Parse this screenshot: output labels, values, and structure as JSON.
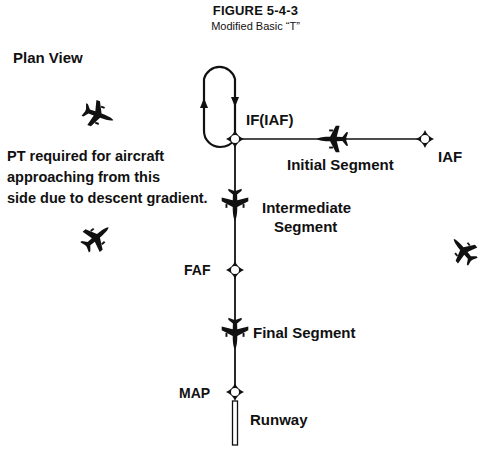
{
  "figure": {
    "title": "FIGURE 5-4-3",
    "subtitle": "Modified Basic “T”"
  },
  "view_label": "Plan View",
  "note": "PT required for aircraft\napproaching from this\nside due to descent gradient.",
  "fixes": {
    "if_iaf": {
      "label": "IF(IAF)",
      "x": 235,
      "y": 139
    },
    "iaf": {
      "label": "IAF",
      "x": 425,
      "y": 139
    },
    "faf": {
      "label": "FAF",
      "x": 235,
      "y": 270
    },
    "map": {
      "label": "MAP",
      "x": 235,
      "y": 392
    }
  },
  "segments": {
    "initial": "Initial Segment",
    "intermediate_line1": "Intermediate",
    "intermediate_line2": "Segment",
    "final": "Final  Segment"
  },
  "runway_label": "Runway",
  "icons": {
    "holding_pattern": "procedure-turn-racetrack",
    "fix": "fix-diamond-circle",
    "aircraft": "airplane-silhouette"
  },
  "colors": {
    "ink": "#111111",
    "background": "#ffffff"
  }
}
